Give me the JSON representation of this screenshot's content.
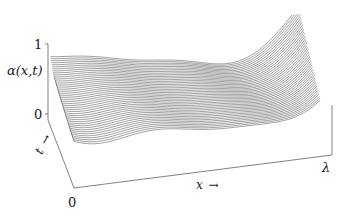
{
  "figure": {
    "kind": "3d-waterfall-surface",
    "background": "#ffffff",
    "line_color": "#2a2a2a"
  },
  "axes": {
    "y_axis_label": "α(x,t)",
    "y_ticks": [
      "1",
      "0"
    ],
    "y_tick_values": [
      1,
      0
    ],
    "x_axis_label": "x →",
    "x_origin_label": "0",
    "x_end_label": "λ",
    "t_axis_label": "t →"
  },
  "chart_data": {
    "type": "line",
    "title": "",
    "xlabel": "x →",
    "ylabel": "α(x,t)",
    "zlabel": "t →",
    "grid": false,
    "legend": "none",
    "xlim": [
      0,
      1
    ],
    "ylim": [
      0,
      1
    ],
    "tlim": [
      0,
      1
    ],
    "x_tick_labels": [
      "0",
      "λ"
    ],
    "y_tick_labels": [
      "1",
      "0"
    ],
    "n_curves": 44,
    "series": [
      {
        "name": "t=0.00",
        "t": 0.0,
        "x": [
          0,
          0.1,
          0.2,
          0.3,
          0.4,
          0.5,
          0.6,
          0.7,
          0.8,
          0.9,
          1.0
        ],
        "values": [
          1.0,
          0.86,
          0.7,
          0.56,
          0.45,
          0.38,
          0.36,
          0.4,
          0.52,
          0.74,
          1.0
        ]
      },
      {
        "name": "t=0.25",
        "t": 0.25,
        "x": [
          0,
          0.1,
          0.2,
          0.3,
          0.4,
          0.5,
          0.6,
          0.7,
          0.8,
          0.9,
          1.0
        ],
        "values": [
          0.92,
          0.8,
          0.66,
          0.54,
          0.44,
          0.38,
          0.37,
          0.42,
          0.55,
          0.77,
          1.0
        ]
      },
      {
        "name": "t=0.50",
        "t": 0.5,
        "x": [
          0,
          0.1,
          0.2,
          0.3,
          0.4,
          0.5,
          0.6,
          0.7,
          0.8,
          0.9,
          1.0
        ],
        "values": [
          0.84,
          0.74,
          0.62,
          0.52,
          0.43,
          0.39,
          0.39,
          0.45,
          0.58,
          0.8,
          1.0
        ]
      },
      {
        "name": "t=0.75",
        "t": 0.75,
        "x": [
          0,
          0.1,
          0.2,
          0.3,
          0.4,
          0.5,
          0.6,
          0.7,
          0.8,
          0.9,
          1.0
        ],
        "values": [
          0.76,
          0.68,
          0.58,
          0.5,
          0.43,
          0.4,
          0.42,
          0.49,
          0.62,
          0.83,
          1.0
        ]
      },
      {
        "name": "t=1.00",
        "t": 1.0,
        "x": [
          0,
          0.1,
          0.2,
          0.3,
          0.4,
          0.5,
          0.6,
          0.7,
          0.8,
          0.9,
          1.0
        ],
        "values": [
          0.68,
          0.62,
          0.55,
          0.49,
          0.44,
          0.42,
          0.45,
          0.53,
          0.66,
          0.86,
          1.0
        ]
      }
    ]
  }
}
